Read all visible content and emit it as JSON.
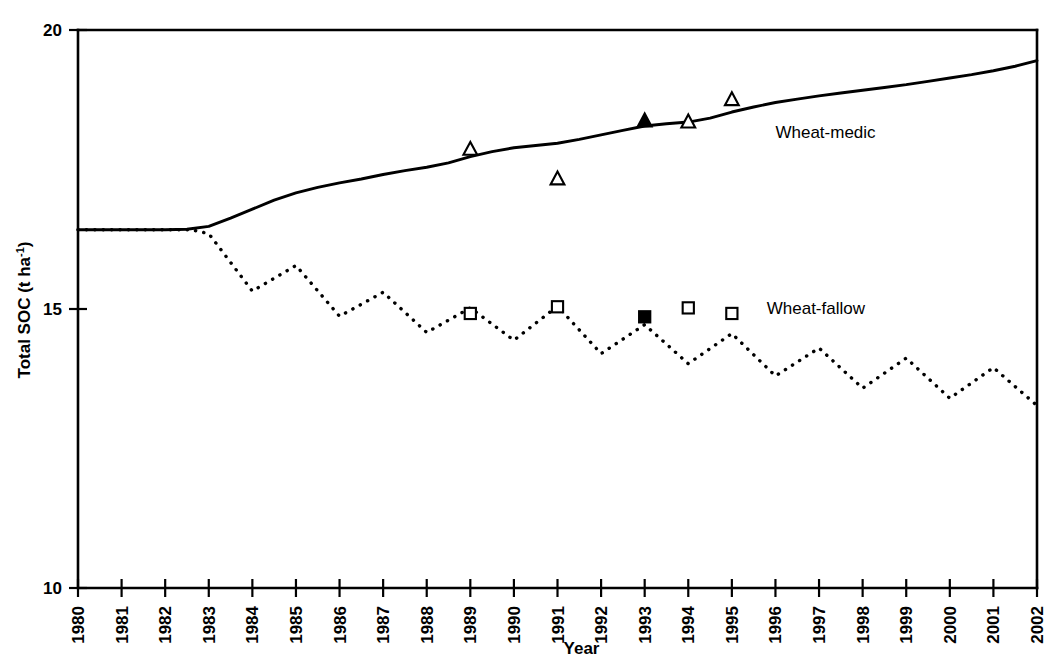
{
  "chart_data": {
    "type": "line",
    "title": "",
    "xlabel": "Year",
    "ylabel": "Total SOC (t ha-1)",
    "ylabel_base": "Total SOC (t ha",
    "ylabel_sup": "-1",
    "ylabel_close": ")",
    "xlim": [
      1980,
      2002
    ],
    "ylim": [
      10,
      20
    ],
    "ytick_values": [
      10,
      15,
      20
    ],
    "ytick_labels": [
      "10",
      "15",
      "20"
    ],
    "xtick_labels": [
      "1980",
      "1981",
      "1982",
      "1983",
      "1984",
      "1985",
      "1986",
      "1987",
      "1988",
      "1989",
      "1990",
      "1991",
      "1992",
      "1993",
      "1994",
      "1995",
      "1996",
      "1997",
      "1998",
      "1999",
      "2000",
      "2001",
      "2002"
    ],
    "grid": false,
    "legend_position": "inline-right",
    "series": [
      {
        "name": "Wheat-medic",
        "style": "solid",
        "label_x": 1996.0,
        "label_y": 18.15,
        "x": [
          1980,
          1981,
          1982,
          1982.5,
          1983,
          1983.5,
          1984,
          1984.5,
          1985,
          1985.5,
          1986,
          1986.5,
          1987,
          1987.5,
          1988,
          1988.5,
          1989,
          1989.5,
          1990,
          1990.5,
          1991,
          1991.5,
          1992,
          1992.5,
          1993,
          1993.5,
          1994,
          1994.5,
          1995,
          1995.5,
          1996,
          1996.5,
          1997,
          1997.5,
          1998,
          1998.5,
          1999,
          1999.5,
          2000,
          2000.5,
          2001,
          2001.5,
          2002
        ],
        "y": [
          16.42,
          16.42,
          16.42,
          16.43,
          16.48,
          16.63,
          16.79,
          16.95,
          17.08,
          17.18,
          17.26,
          17.33,
          17.41,
          17.48,
          17.54,
          17.62,
          17.73,
          17.82,
          17.89,
          17.93,
          17.97,
          18.04,
          18.12,
          18.2,
          18.28,
          18.32,
          18.35,
          18.42,
          18.53,
          18.62,
          18.7,
          18.76,
          18.82,
          18.87,
          18.92,
          18.97,
          19.02,
          19.08,
          19.14,
          19.2,
          19.27,
          19.35,
          19.45
        ],
        "markers": [
          {
            "x": 1989,
            "y": 17.86,
            "shape": "triangle",
            "fill": "open"
          },
          {
            "x": 1991,
            "y": 17.33,
            "shape": "triangle",
            "fill": "open"
          },
          {
            "x": 1993,
            "y": 18.37,
            "shape": "triangle",
            "fill": "filled"
          },
          {
            "x": 1994,
            "y": 18.35,
            "shape": "triangle",
            "fill": "open"
          },
          {
            "x": 1995,
            "y": 18.75,
            "shape": "triangle",
            "fill": "open"
          }
        ]
      },
      {
        "name": "Wheat-fallow",
        "style": "dotted",
        "label_x": 1995.8,
        "label_y": 15.0,
        "x": [
          1980,
          1981,
          1982,
          1982.6,
          1983,
          1984,
          1985,
          1986,
          1987,
          1988,
          1989,
          1990,
          1991,
          1992,
          1993,
          1994,
          1995,
          1996,
          1997,
          1998,
          1999,
          2000,
          2001,
          2002
        ],
        "y": [
          16.42,
          16.42,
          16.42,
          16.42,
          16.35,
          15.32,
          15.78,
          14.87,
          15.3,
          14.58,
          15.02,
          14.44,
          15.05,
          14.2,
          14.72,
          14.02,
          14.56,
          13.8,
          14.3,
          13.58,
          14.12,
          13.4,
          13.95,
          13.27
        ],
        "markers": [
          {
            "x": 1989,
            "y": 14.92,
            "shape": "square",
            "fill": "open"
          },
          {
            "x": 1991,
            "y": 15.04,
            "shape": "square",
            "fill": "open"
          },
          {
            "x": 1993,
            "y": 14.86,
            "shape": "square",
            "fill": "filled"
          },
          {
            "x": 1994,
            "y": 15.02,
            "shape": "square",
            "fill": "open"
          },
          {
            "x": 1995,
            "y": 14.92,
            "shape": "square",
            "fill": "open"
          }
        ]
      }
    ]
  }
}
